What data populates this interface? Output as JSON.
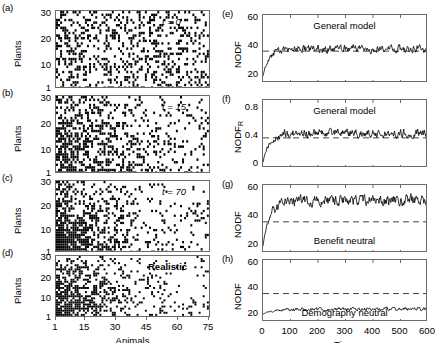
{
  "figure": {
    "background": "#ffffff",
    "ink": "#000000",
    "axis_color": "#6b6b6b"
  },
  "matrix_panels": [
    {
      "letter": "(a)",
      "annotation": "t = 0",
      "annotation_style": "italic",
      "ylabel": "Plants",
      "yticks": [
        "1",
        "10",
        "20",
        "30"
      ],
      "ytick_values": [
        1,
        10,
        20,
        30
      ],
      "ylim": [
        1,
        31
      ],
      "xlim": [
        1,
        76
      ],
      "show_xaxis": false,
      "fill": 0.28,
      "gradient": "uniform"
    },
    {
      "letter": "(b)",
      "annotation": "t = 15",
      "annotation_style": "italic",
      "ylabel": "Plants",
      "yticks": [
        "1",
        "10",
        "20",
        "30"
      ],
      "ytick_values": [
        1,
        10,
        20,
        30
      ],
      "ylim": [
        1,
        31
      ],
      "xlim": [
        1,
        76
      ],
      "show_xaxis": false,
      "fill": 0.26,
      "gradient": "mild-nested"
    },
    {
      "letter": "(c)",
      "annotation": "t = 70",
      "annotation_style": "italic",
      "ylabel": "Plants",
      "yticks": [
        "1",
        "10",
        "20",
        "30"
      ],
      "ytick_values": [
        1,
        10,
        20,
        30
      ],
      "ylim": [
        1,
        31
      ],
      "xlim": [
        1,
        76
      ],
      "show_xaxis": false,
      "fill": 0.24,
      "gradient": "nested"
    },
    {
      "letter": "(d)",
      "annotation": "Realistic",
      "annotation_style": "bold",
      "ylabel": "Plants",
      "yticks": [
        "1",
        "10",
        "20",
        "30"
      ],
      "ytick_values": [
        1,
        10,
        20,
        30
      ],
      "ylim": [
        1,
        31
      ],
      "xlim": [
        1,
        76
      ],
      "show_xaxis": true,
      "xlabel": "Animals",
      "xticks": [
        "1",
        "15",
        "30",
        "45",
        "60",
        "75"
      ],
      "xtick_values": [
        1,
        15,
        30,
        45,
        60,
        75
      ],
      "fill": 0.22,
      "gradient": "nested"
    }
  ],
  "time_panels": [
    {
      "letter": "(e)",
      "ylabel": "NODF",
      "ylabel_sub": "",
      "title_inside": "General model",
      "yticks": [
        "20",
        "40",
        "60"
      ],
      "ytick_values": [
        20,
        40,
        60
      ],
      "ylim": [
        14,
        62
      ],
      "xlim": [
        0,
        600
      ],
      "dashed_reference": 36.5,
      "show_xaxis": false,
      "series_start": 19,
      "series_plateau": 38,
      "series_noise": 2.2,
      "rise_time": 22
    },
    {
      "letter": "(f)",
      "ylabel": "NODF",
      "ylabel_sub": "R",
      "title_inside": "General model",
      "yticks": [
        "0",
        "0.4",
        "0.8"
      ],
      "ytick_values": [
        0,
        0.4,
        0.8
      ],
      "ylim": [
        -0.05,
        0.92
      ],
      "xlim": [
        0,
        600
      ],
      "dashed_reference": 0.38,
      "show_xaxis": false,
      "series_start": 0.03,
      "series_plateau": 0.44,
      "series_noise": 0.05,
      "rise_time": 22
    },
    {
      "letter": "(g)",
      "ylabel": "NODF",
      "ylabel_sub": "",
      "title_inside": "Benefit neutral",
      "title_position": "below",
      "yticks": [
        "20",
        "40",
        "60"
      ],
      "ytick_values": [
        20,
        40,
        60
      ],
      "ylim": [
        14,
        62
      ],
      "xlim": [
        0,
        600
      ],
      "dashed_reference": 36.0,
      "show_xaxis": false,
      "series_start": 19,
      "series_plateau": 51,
      "series_noise": 3.0,
      "rise_time": 25
    },
    {
      "letter": "(h)",
      "ylabel": "NODF",
      "ylabel_sub": "",
      "title_inside": "Demography neutral",
      "title_position": "below",
      "yticks": [
        "20",
        "40",
        "60"
      ],
      "ytick_values": [
        20,
        40,
        60
      ],
      "ylim": [
        14,
        62
      ],
      "xlim": [
        0,
        600
      ],
      "dashed_reference": 36.0,
      "show_xaxis": true,
      "xlabel": "Time",
      "xticks": [
        "0",
        "100",
        "200",
        "300",
        "400",
        "500",
        "600"
      ],
      "xtick_values": [
        0,
        100,
        200,
        300,
        400,
        500,
        600
      ],
      "series_start": 20,
      "series_plateau": 24,
      "series_noise": 1.1,
      "rise_time": 30
    }
  ],
  "chart_data": {
    "type": "scatter",
    "title": "",
    "panels": {
      "a": {
        "type": "matrix",
        "xlabel": "Animals",
        "ylabel": "Plants",
        "xlim": [
          1,
          75
        ],
        "ylim": [
          1,
          30
        ],
        "annotation": "t = 0"
      },
      "b": {
        "type": "matrix",
        "xlabel": "Animals",
        "ylabel": "Plants",
        "xlim": [
          1,
          75
        ],
        "ylim": [
          1,
          30
        ],
        "annotation": "t = 15"
      },
      "c": {
        "type": "matrix",
        "xlabel": "Animals",
        "ylabel": "Plants",
        "xlim": [
          1,
          75
        ],
        "ylim": [
          1,
          30
        ],
        "annotation": "t = 70"
      },
      "d": {
        "type": "matrix",
        "xlabel": "Animals",
        "ylabel": "Plants",
        "xlim": [
          1,
          75
        ],
        "ylim": [
          1,
          30
        ],
        "annotation": "Realistic"
      },
      "e": {
        "type": "line",
        "xlabel": "Time",
        "ylabel": "NODF",
        "xlim": [
          0,
          600
        ],
        "ylim": [
          14,
          62
        ],
        "yticks": [
          20,
          40,
          60
        ],
        "annotation": "General model",
        "reference_line": 36.5,
        "start_value": 19,
        "plateau_value": 38
      },
      "f": {
        "type": "line",
        "xlabel": "Time",
        "ylabel": "NODF_R",
        "xlim": [
          0,
          600
        ],
        "ylim": [
          -0.05,
          0.92
        ],
        "yticks": [
          0,
          0.4,
          0.8
        ],
        "annotation": "General model",
        "reference_line": 0.38,
        "start_value": 0.03,
        "plateau_value": 0.44
      },
      "g": {
        "type": "line",
        "xlabel": "Time",
        "ylabel": "NODF",
        "xlim": [
          0,
          600
        ],
        "ylim": [
          14,
          62
        ],
        "yticks": [
          20,
          40,
          60
        ],
        "annotation": "Benefit neutral",
        "reference_line": 36.0,
        "start_value": 19,
        "plateau_value": 51
      },
      "h": {
        "type": "line",
        "xlabel": "Time",
        "ylabel": "NODF",
        "xlim": [
          0,
          600
        ],
        "ylim": [
          14,
          62
        ],
        "yticks": [
          20,
          40,
          60
        ],
        "annotation": "Demography neutral",
        "reference_line": 36.0,
        "start_value": 20,
        "plateau_value": 24
      }
    },
    "grid": false,
    "legend": "none"
  }
}
